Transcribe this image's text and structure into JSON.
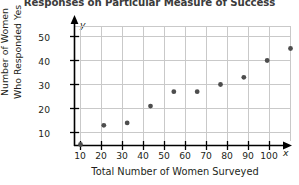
{
  "chart_data": {
    "type": "scatter",
    "title": "Responses on Particular Measure of Success",
    "xlabel": "Total Number of Women Surveyed",
    "ylabel": "Number of Women Who Responded Yes",
    "ylabel_lines": [
      "Number of Women",
      "Who Responded Yes"
    ],
    "x_axis_letter": "x",
    "y_axis_letter": "y",
    "xlim": [
      0,
      110
    ],
    "ylim": [
      0,
      57
    ],
    "xticks": [
      10,
      20,
      30,
      40,
      50,
      60,
      70,
      80,
      90,
      100
    ],
    "yticks": [
      10,
      20,
      30,
      40,
      50
    ],
    "xtick_labels": [
      "10",
      "20",
      "30",
      "40",
      "50",
      "60",
      "70",
      "80",
      "90",
      "100"
    ],
    "ytick_labels": [
      "10",
      "20",
      "30",
      "40",
      "50"
    ],
    "grid": true,
    "legend": "none",
    "x": [
      10,
      20,
      30,
      40,
      50,
      60,
      70,
      80,
      90,
      100
    ],
    "y": [
      5,
      13,
      14,
      21,
      27,
      27,
      30,
      33,
      40,
      45
    ],
    "points": [
      {
        "x": 10,
        "y": 5
      },
      {
        "x": 20,
        "y": 13
      },
      {
        "x": 30,
        "y": 14
      },
      {
        "x": 40,
        "y": 21
      },
      {
        "x": 50,
        "y": 27
      },
      {
        "x": 60,
        "y": 27
      },
      {
        "x": 70,
        "y": 30
      },
      {
        "x": 80,
        "y": 33
      },
      {
        "x": 90,
        "y": 40
      },
      {
        "x": 100,
        "y": 45
      }
    ],
    "marker_color": "#4d4d4d",
    "grid_color": "#c9c9c9",
    "axis_color": "#000000"
  }
}
